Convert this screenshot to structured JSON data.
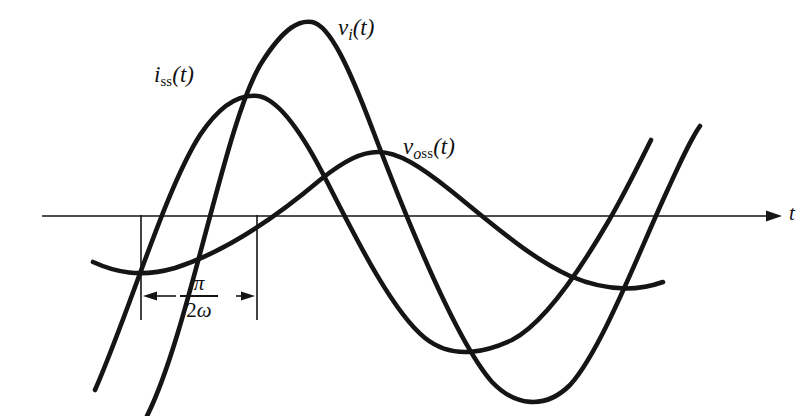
{
  "figure": {
    "background_color": "#ffffff",
    "ink_color": "#151515",
    "axis": {
      "name": "time-axis",
      "label": "t",
      "y": 216,
      "x_start": 42,
      "x_end": 782,
      "arrow": true
    },
    "labels": {
      "current_steady_state": {
        "base": "i",
        "subscript": "ss",
        "arg": "(t)",
        "text": "i_ss(t)"
      },
      "input_voltage": {
        "base": "v",
        "subscript": "i",
        "arg": "(t)",
        "text": "v_i(t)"
      },
      "output_steady_state": {
        "base": "v",
        "subscript": "oss",
        "arg": "(t)",
        "text": "v_oss(t)"
      },
      "axis_label": "t"
    },
    "dimension": {
      "name": "phase-shift-dimension",
      "numerator": "π",
      "denominator_coeff": "2",
      "denominator_symbol": "ω",
      "text": "π/2ω",
      "left_x": 141,
      "right_x": 257,
      "y": 296,
      "ext_top_y": 215,
      "ext_bottom_y": 320
    }
  },
  "chart_data": {
    "type": "line",
    "title": "",
    "xlabel": "t",
    "ylabel": "",
    "grid": false,
    "legend": "inline-annotations",
    "axis_y_pixel": 216,
    "xlim_pixels": [
      42,
      782
    ],
    "series": [
      {
        "name": "v_i(t)",
        "label": "v_i(t)",
        "color": "#151515",
        "amplitude_px": 194,
        "zero_crossings_px": [
          190,
          420,
          655
        ],
        "peak_px": {
          "x": 308,
          "y": 22
        },
        "trough_px": {
          "x": 540,
          "y": 400
        },
        "path": "M 147,416 C 190,330 225,120 262,62 C 285,26 300,20 312,22 C 330,25 350,70 372,128 C 405,215 455,340 492,382 C 515,406 545,410 570,385 C 600,352 635,262 663,200 C 678,167 690,140 700,126"
      },
      {
        "name": "i_ss(t)",
        "label": "i_ss(t)",
        "color": "#151515",
        "amplitude_px": 128,
        "zero_crossings_px": [
          140,
          372,
          613
        ],
        "peak_px": {
          "x": 256,
          "y": 96
        },
        "trough_px": {
          "x": 505,
          "y": 344
        },
        "path": "M 95,390 C 130,310 165,190 200,135 C 222,102 242,94 258,96 C 278,99 300,130 322,172 C 350,226 390,310 425,338 C 455,362 490,350 512,340 C 545,323 580,270 608,222 C 625,193 640,162 651,140"
      },
      {
        "name": "v_oss(t)",
        "label": "v_oss(t)",
        "color": "#151515",
        "amplitude_px": 66,
        "zero_crossings_px": [
          258,
          485
        ],
        "peak_px": {
          "x": 376,
          "y": 152
        },
        "trough_px": {
          "x": 93,
          "y": 264
        },
        "trough_px_right": {
          "x": 655,
          "y": 285
        },
        "path": "M 93,262 C 115,272 140,278 175,268 C 225,252 275,218 320,180 C 345,160 362,152 378,152 C 398,152 420,166 450,190 C 490,222 530,258 570,276 C 605,291 635,292 663,282"
      }
    ]
  }
}
